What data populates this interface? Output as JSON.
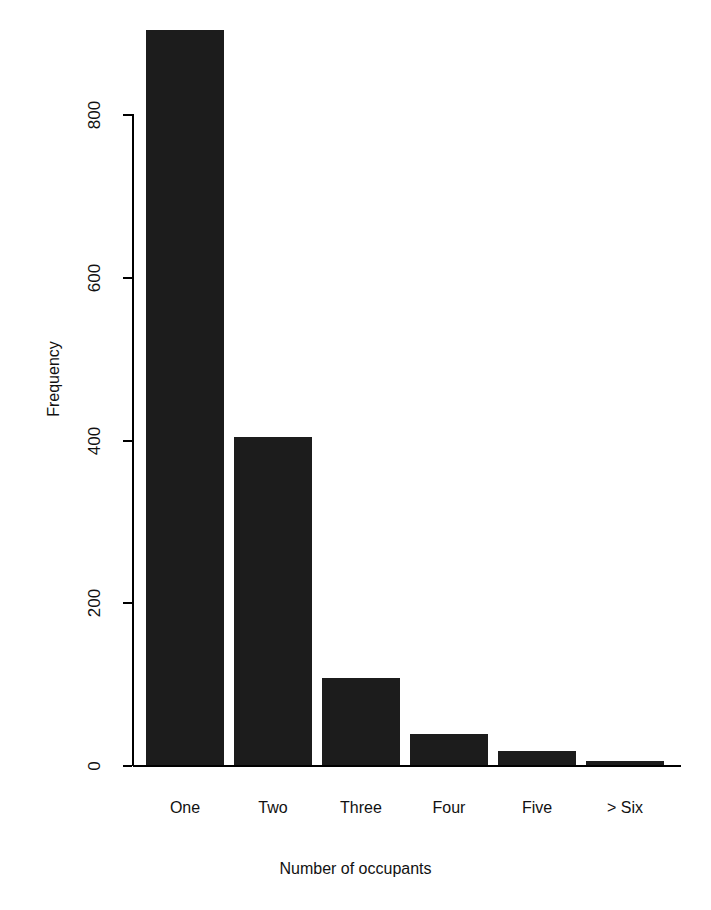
{
  "chart_data": {
    "type": "bar",
    "title": "",
    "subtitle": "",
    "xlabel": "Number of occupants",
    "ylabel": "Frequency",
    "categories": [
      "One",
      "Two",
      "Three",
      "Four",
      "Five",
      "> Six"
    ],
    "values": [
      903,
      404,
      108,
      39,
      18,
      6
    ],
    "series": [
      {
        "name": "Frequency",
        "values": [
          903,
          404,
          108,
          39,
          18,
          6
        ]
      }
    ],
    "ylim": [
      0,
      903
    ],
    "yticks": [
      0,
      200,
      400,
      600,
      800
    ],
    "ytick_labels": [
      "0",
      "200",
      "400",
      "600",
      "800"
    ],
    "xtick_labels": [
      "One",
      "Two",
      "Three",
      "Four",
      "Five",
      "> Six"
    ],
    "grid": false,
    "legend": false,
    "legend_position": "none",
    "bar_color": "#1c1c1c",
    "axis_color": "#000000",
    "background_color": "#ffffff"
  },
  "figure": {
    "y_axis_title": "Frequency",
    "x_axis_title": "Number of occupants"
  }
}
